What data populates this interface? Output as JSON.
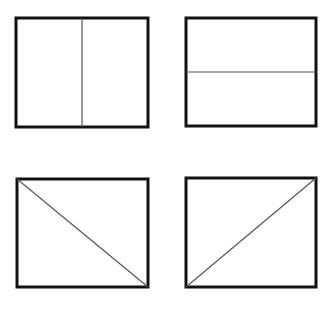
{
  "diagram": {
    "colors": {
      "background": "#ffffff",
      "border": "#111111",
      "divider": "#555555"
    },
    "panels": [
      {
        "id": "top-left",
        "division": "vertical",
        "rect": {
          "x": 16,
          "y": 18,
          "w": 132,
          "h": 109
        },
        "line": {
          "x1": 82,
          "y1": 18,
          "x2": 82,
          "y2": 127
        }
      },
      {
        "id": "top-right",
        "division": "horizontal",
        "rect": {
          "x": 186,
          "y": 18,
          "w": 130,
          "h": 108
        },
        "line": {
          "x1": 186,
          "y1": 72,
          "x2": 316,
          "y2": 72
        }
      },
      {
        "id": "bottom-left",
        "division": "diagonal-down",
        "rect": {
          "x": 17,
          "y": 179,
          "w": 131,
          "h": 108
        },
        "line": {
          "x1": 17,
          "y1": 179,
          "x2": 148,
          "y2": 287
        }
      },
      {
        "id": "bottom-right",
        "division": "diagonal-up",
        "rect": {
          "x": 186,
          "y": 178,
          "w": 130,
          "h": 109
        },
        "line": {
          "x1": 186,
          "y1": 287,
          "x2": 316,
          "y2": 178
        }
      }
    ]
  }
}
